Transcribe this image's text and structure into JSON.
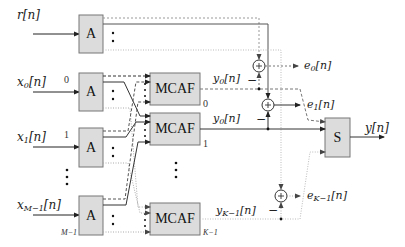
{
  "diagram": {
    "inputs": [
      {
        "label": "r[n]",
        "base": "r",
        "sub": "",
        "arg": "[n]",
        "index": ""
      },
      {
        "label": "x0[n]",
        "base": "x",
        "sub": "0",
        "arg": "[n]",
        "index": "0"
      },
      {
        "label": "x1[n]",
        "base": "x",
        "sub": "1",
        "arg": "[n]",
        "index": "1"
      },
      {
        "label": "xM-1[n]",
        "base": "x",
        "sub": "M−1",
        "arg": "[n]",
        "index": "M−1"
      }
    ],
    "analysis_block_label": "A",
    "mcaf_blocks": [
      {
        "label": "MCAF",
        "index": "0",
        "output": {
          "base": "y",
          "sub": "0",
          "arg": "[n]"
        }
      },
      {
        "label": "MCAF",
        "index": "1",
        "output": {
          "base": "y",
          "sub": "0",
          "arg": "[n]"
        }
      },
      {
        "label": "MCAF",
        "index": "K−1",
        "output": {
          "base": "y",
          "sub": "K−1",
          "arg": "[n]"
        }
      }
    ],
    "errors": [
      {
        "base": "e",
        "sub": "0",
        "arg": "[n]"
      },
      {
        "base": "e",
        "sub": "1",
        "arg": "[n]"
      },
      {
        "base": "e",
        "sub": "K−1",
        "arg": "[n]"
      }
    ],
    "synthesis_block_label": "S",
    "output_label": "y[n]",
    "minus_sign": "−",
    "plus_sign": "+"
  }
}
